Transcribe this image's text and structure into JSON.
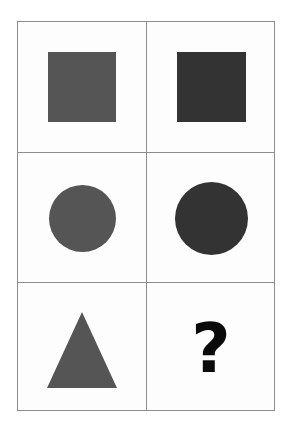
{
  "puzzle": {
    "title": "Shape Analogy Matrix",
    "background_color": "#ffffff",
    "frame_color": "#8d8d8d",
    "grid": {
      "rows": 3,
      "columns": 2
    },
    "cells": [
      {
        "id": "r1c1",
        "row": 1,
        "column": 1,
        "shape": "square",
        "fill": "#555555",
        "label": "medium gray square"
      },
      {
        "id": "r1c2",
        "row": 1,
        "column": 2,
        "shape": "square",
        "fill": "#333333",
        "label": "dark gray square"
      },
      {
        "id": "r2c1",
        "row": 2,
        "column": 1,
        "shape": "circle",
        "fill": "#555555",
        "label": "medium gray circle"
      },
      {
        "id": "r2c2",
        "row": 2,
        "column": 2,
        "shape": "circle",
        "fill": "#333333",
        "label": "dark gray circle"
      },
      {
        "id": "r3c1",
        "row": 3,
        "column": 1,
        "shape": "triangle",
        "fill": "#555555",
        "label": "medium gray triangle"
      },
      {
        "id": "r3c2",
        "row": 3,
        "column": 2,
        "shape": "question-mark",
        "fill": "#0a0a0a",
        "label": "missing answer",
        "text": "?"
      }
    ]
  }
}
